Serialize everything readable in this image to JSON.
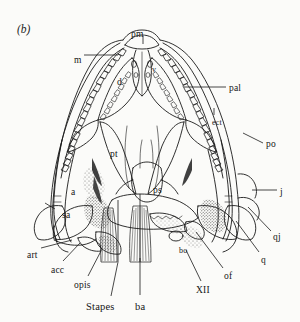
{
  "figure": {
    "panel_label": "(b)",
    "caption_visible": "",
    "background_color": "#fbfbf9",
    "line_color": "#1a1a1a"
  },
  "labels": [
    {
      "id": "pm",
      "text": "pm",
      "x": 131,
      "y": 30,
      "size": "normal"
    },
    {
      "id": "m",
      "text": "m",
      "x": 74,
      "y": 56,
      "size": "normal"
    },
    {
      "id": "d",
      "text": "d",
      "x": 117,
      "y": 78,
      "size": "normal"
    },
    {
      "id": "v",
      "text": "v",
      "x": 152,
      "y": 66,
      "size": "small"
    },
    {
      "id": "pal",
      "text": "pal",
      "x": 229,
      "y": 84,
      "size": "normal"
    },
    {
      "id": "ect",
      "text": "ect",
      "x": 212,
      "y": 119,
      "size": "small"
    },
    {
      "id": "po",
      "text": "po",
      "x": 266,
      "y": 140,
      "size": "normal"
    },
    {
      "id": "pt",
      "text": "pt",
      "x": 110,
      "y": 150,
      "size": "normal"
    },
    {
      "id": "ps",
      "text": "ps",
      "x": 153,
      "y": 186,
      "size": "normal"
    },
    {
      "id": "j",
      "text": "j",
      "x": 280,
      "y": 188,
      "size": "normal"
    },
    {
      "id": "a",
      "text": "a",
      "x": 71,
      "y": 188,
      "size": "normal"
    },
    {
      "id": "sa",
      "text": "sa",
      "x": 62,
      "y": 211,
      "size": "normal"
    },
    {
      "id": "qj",
      "text": "qj",
      "x": 273,
      "y": 233,
      "size": "normal"
    },
    {
      "id": "q",
      "text": "q",
      "x": 261,
      "y": 256,
      "size": "normal"
    },
    {
      "id": "art",
      "text": "art",
      "x": 27,
      "y": 251,
      "size": "normal"
    },
    {
      "id": "acc",
      "text": "acc",
      "x": 51,
      "y": 266,
      "size": "normal"
    },
    {
      "id": "opis",
      "text": "opis",
      "x": 74,
      "y": 281,
      "size": "normal"
    },
    {
      "id": "bo",
      "text": "bo",
      "x": 179,
      "y": 247,
      "size": "small"
    },
    {
      "id": "XII",
      "text": "XII",
      "x": 196,
      "y": 286,
      "size": "normal"
    },
    {
      "id": "of",
      "text": "of",
      "x": 224,
      "y": 272,
      "size": "normal"
    },
    {
      "id": "stapes",
      "text": "Stapes",
      "x": 86,
      "y": 302,
      "size": "big"
    },
    {
      "id": "ba",
      "text": "ba",
      "x": 135,
      "y": 302,
      "size": "big"
    }
  ],
  "label_meanings": {
    "pm": "premaxilla",
    "m": "maxilla",
    "d": "dentary",
    "v": "vomer",
    "pal": "palatine",
    "ect": "ectopterygoid",
    "po": "postorbital",
    "pt": "pterygoid",
    "ps": "parasphenoid",
    "j": "jugal",
    "a": "angular",
    "sa": "surangular",
    "qj": "quadratojugal",
    "q": "quadrate",
    "art": "articular",
    "acc": "accessory ossification",
    "opis": "opisthotic",
    "bo": "basioccipital",
    "XII": "hypoglossal foramen",
    "of": "occipital foramen",
    "Stapes": "stapes",
    "ba": "basal articulation"
  },
  "leaders": [
    {
      "id": "leader-m",
      "x1": 84,
      "y1": 55,
      "x2": 118,
      "y2": 55
    },
    {
      "id": "leader-pm",
      "x1": 143,
      "y1": 36,
      "x2": 143,
      "y2": 44
    },
    {
      "id": "leader-pal",
      "x1": 226,
      "y1": 87,
      "x2": 184,
      "y2": 87
    },
    {
      "id": "leader-po",
      "x1": 263,
      "y1": 143,
      "x2": 243,
      "y2": 133
    },
    {
      "id": "leader-j",
      "x1": 277,
      "y1": 190,
      "x2": 252,
      "y2": 190
    },
    {
      "id": "leader-qj",
      "x1": 271,
      "y1": 231,
      "x2": 248,
      "y2": 207
    },
    {
      "id": "leader-q",
      "x1": 259,
      "y1": 252,
      "x2": 236,
      "y2": 221
    },
    {
      "id": "leader-art",
      "x1": 41,
      "y1": 248,
      "x2": 72,
      "y2": 240
    },
    {
      "id": "leader-acc",
      "x1": 63,
      "y1": 261,
      "x2": 80,
      "y2": 243
    },
    {
      "id": "leader-opis",
      "x1": 88,
      "y1": 276,
      "x2": 101,
      "y2": 251
    },
    {
      "id": "leader-stapes",
      "x1": 111,
      "y1": 296,
      "x2": 118,
      "y2": 262
    },
    {
      "id": "leader-ba",
      "x1": 140,
      "y1": 295,
      "x2": 140,
      "y2": 258
    },
    {
      "id": "leader-xii",
      "x1": 201,
      "y1": 281,
      "x2": 186,
      "y2": 250
    },
    {
      "id": "leader-of",
      "x1": 223,
      "y1": 268,
      "x2": 196,
      "y2": 232
    },
    {
      "id": "leader-sa",
      "x1": 55,
      "y1": 209,
      "x2": 45,
      "y2": 203
    },
    {
      "id": "leader-ect",
      "x1": 214,
      "y1": 115,
      "x2": 214,
      "y2": 108
    }
  ],
  "view": {
    "subject": "skull",
    "orientation": "ventral / palatal view",
    "style": "pen-and-ink line drawing with stipple shading"
  }
}
